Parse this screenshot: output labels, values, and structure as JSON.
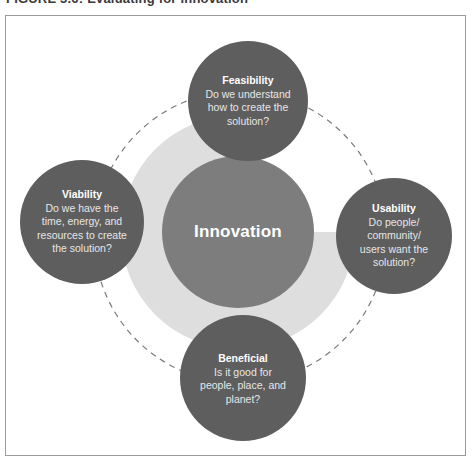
{
  "caption": "FIGURE 3.6: Evaluating for innovation",
  "colors": {
    "outer_circle": "#5e5e5e",
    "center_circle": "#7d7d7d",
    "background_pie": "#dedede",
    "dashed_ring": "#7a7a7a",
    "frame_border": "#9a9a9a",
    "text_light": "#ffffff"
  },
  "center": {
    "label": "Innovation"
  },
  "nodes": {
    "feasibility": {
      "title": "Feasibility",
      "line1": "Do we understand",
      "line2": "how to create the",
      "line3": "solution?"
    },
    "viability": {
      "title": "Viability",
      "line1": "Do we have the",
      "line2": "time, energy, and",
      "line3": "resources to create",
      "line4": "the solution?"
    },
    "usability": {
      "title": "Usability",
      "line1": "Do people/",
      "line2": "community/",
      "line3": "users want the",
      "line4": "solution?"
    },
    "beneficial": {
      "title": "Beneficial",
      "line1": "Is it good for",
      "line2": "people, place, and",
      "line3": "planet?"
    }
  }
}
